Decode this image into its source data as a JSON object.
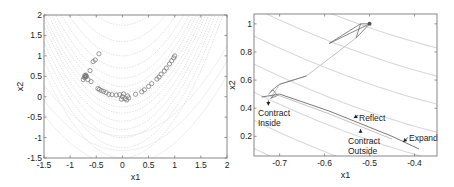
{
  "chart_data": [
    {
      "type": "scatter",
      "title": "",
      "xlabel": "x1",
      "ylabel": "x2",
      "xlim": [
        -1.5,
        2
      ],
      "ylim": [
        -1.5,
        2
      ],
      "xticks": [
        -1.5,
        -1,
        -0.5,
        0,
        0.5,
        1,
        1.5,
        2
      ],
      "xtick_labels": [
        "-1.5",
        "-1",
        "-0.5",
        "0",
        "0.5",
        "1",
        "1.5",
        "2"
      ],
      "yticks": [
        -1.5,
        -1,
        -0.5,
        0,
        0.5,
        1,
        1.5,
        2
      ],
      "ytick_labels": [
        "-1.5",
        "-1",
        "-0.5",
        "0",
        "0.5",
        "1",
        "1.5",
        "2"
      ],
      "grid": false,
      "background": "contour lines of Rosenbrock function (light gray dotted)",
      "marker": "open circle",
      "marker_color": "#666666",
      "points": [
        [
          -0.45,
          1.05
        ],
        [
          -0.52,
          0.9
        ],
        [
          -0.56,
          0.86
        ],
        [
          -0.62,
          0.64
        ],
        [
          -0.7,
          0.5
        ],
        [
          -0.72,
          0.52
        ],
        [
          -0.71,
          0.48
        ],
        [
          -0.69,
          0.5
        ],
        [
          -0.73,
          0.47
        ],
        [
          -0.7,
          0.53
        ],
        [
          -0.75,
          0.42
        ],
        [
          -0.66,
          0.42
        ],
        [
          -0.6,
          0.37
        ],
        [
          -0.47,
          0.2
        ],
        [
          -0.44,
          0.18
        ],
        [
          -0.4,
          0.15
        ],
        [
          -0.36,
          0.13
        ],
        [
          -0.31,
          0.1
        ],
        [
          -0.26,
          0.06
        ],
        [
          -0.2,
          0.05
        ],
        [
          -0.12,
          0.04
        ],
        [
          -0.05,
          0.05
        ],
        [
          0.0,
          0.0
        ],
        [
          0.05,
          -0.05
        ],
        [
          0.1,
          0.02
        ],
        [
          0.12,
          -0.03
        ],
        [
          0.08,
          -0.08
        ],
        [
          -0.02,
          -0.06
        ],
        [
          0.02,
          0.07
        ],
        [
          0.25,
          0.06
        ],
        [
          0.37,
          0.12
        ],
        [
          0.42,
          0.17
        ],
        [
          0.5,
          0.25
        ],
        [
          0.56,
          0.32
        ],
        [
          0.66,
          0.43
        ],
        [
          0.7,
          0.48
        ],
        [
          0.74,
          0.55
        ],
        [
          0.8,
          0.63
        ],
        [
          0.84,
          0.7
        ],
        [
          0.9,
          0.8
        ],
        [
          0.94,
          0.88
        ],
        [
          0.98,
          0.95
        ],
        [
          1.0,
          1.0
        ]
      ]
    },
    {
      "type": "line",
      "title": "",
      "xlabel": "x1",
      "ylabel": "x2",
      "xlim": [
        -0.757,
        -0.35
      ],
      "ylim": [
        0.06,
        1.07
      ],
      "xticks": [
        -0.7,
        -0.6,
        -0.5,
        -0.4
      ],
      "xtick_labels": [
        "-0.7",
        "-0.6",
        "-0.5",
        "-0.4"
      ],
      "yticks": [
        0.2,
        0.4,
        0.6,
        0.8,
        1
      ],
      "ytick_labels": [
        "0.2",
        "0.4",
        "0.6",
        "0.8",
        "1"
      ],
      "grid": false,
      "background": "contour lines (light gray)",
      "description": "Nelder-Mead simplex path",
      "path_dark": [
        [
          -0.5,
          1.0
        ],
        [
          -0.52,
          1.0
        ],
        [
          -0.59,
          0.86
        ],
        [
          -0.5,
          1.0
        ],
        [
          -0.53,
          0.9
        ],
        [
          -0.52,
          1.0
        ]
      ],
      "path_light": [
        [
          -0.53,
          0.9
        ],
        [
          -0.64,
          0.63
        ],
        [
          -0.7,
          0.57
        ],
        [
          -0.71,
          0.52
        ],
        [
          -0.72,
          0.48
        ]
      ],
      "path_descent": [
        [
          -0.74,
          0.48
        ],
        [
          -0.7,
          0.5
        ],
        [
          -0.59,
          0.38
        ],
        [
          -0.45,
          0.2
        ],
        [
          -0.39,
          0.11
        ]
      ],
      "path_descent2": [
        [
          -0.71,
          0.5
        ],
        [
          -0.59,
          0.36
        ],
        [
          -0.45,
          0.18
        ]
      ],
      "annotations": [
        {
          "text": [
            "Contract",
            "Inside"
          ],
          "arrow_to": [
            -0.725,
            0.42
          ]
        },
        {
          "text": [
            "Reflect"
          ],
          "arrow_to": [
            -0.535,
            0.33
          ]
        },
        {
          "text": [
            "Contract",
            "Outside"
          ],
          "arrow_to": [
            -0.52,
            0.25
          ]
        },
        {
          "text": [
            "Expand"
          ],
          "arrow_to": [
            -0.425,
            0.16
          ]
        }
      ]
    }
  ],
  "colors": {
    "axis": "#7a7a7a",
    "contour": "#d9d9d9",
    "marker": "#707070",
    "path_dark": "#6b6b6b",
    "path_light": "#bcbcbc",
    "text": "#222222"
  }
}
